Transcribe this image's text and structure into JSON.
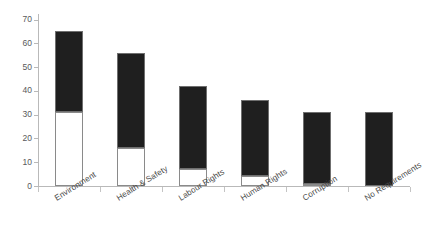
{
  "chart_data": {
    "type": "bar",
    "title": "",
    "xlabel": "",
    "ylabel": "",
    "ylim": [
      0,
      70
    ],
    "ytick_values": [
      0,
      10,
      20,
      30,
      40,
      50,
      60,
      70
    ],
    "ytick_labels": [
      "0",
      "10",
      "20",
      "30",
      "40",
      "50",
      "60",
      "70"
    ],
    "grid": false,
    "legend": null,
    "stacked": true,
    "categories": [
      "Environment",
      "Health & Safety",
      "Labour Rights",
      "Human Rights",
      "Corruption",
      "No Requirements"
    ],
    "series": [
      {
        "name": "Lower segment (white / unfilled)",
        "color": "#ffffff",
        "values": [
          31,
          16,
          7,
          4,
          1,
          0
        ]
      },
      {
        "name": "Upper segment (filled / black)",
        "color": "#1f1f1f",
        "values": [
          34,
          40,
          35,
          32,
          30,
          31
        ]
      }
    ],
    "totals": [
      65,
      56,
      42,
      36,
      31,
      31
    ]
  },
  "axis": {
    "y_label_color": "#58595b",
    "line_color": "#b9b9b9"
  },
  "bars": [
    {
      "label": "Environment",
      "total": 65,
      "white": 31,
      "black": 34
    },
    {
      "label": "Health & Safety",
      "total": 56,
      "white": 16,
      "black": 40
    },
    {
      "label": "Labour Rights",
      "total": 42,
      "white": 7,
      "black": 35
    },
    {
      "label": "Human Rights",
      "total": 36,
      "white": 4,
      "black": 32
    },
    {
      "label": "Corruption",
      "total": 31,
      "white": 1,
      "black": 30
    },
    {
      "label": "No Requirements",
      "total": 31,
      "white": 0,
      "black": 31
    }
  ],
  "colors": {
    "bar_fill": "#1f1f1f",
    "bar_empty": "#ffffff",
    "bar_stroke": "#6f6f6f",
    "axis": "#b9b9b9",
    "text": "#4a4a4a"
  }
}
